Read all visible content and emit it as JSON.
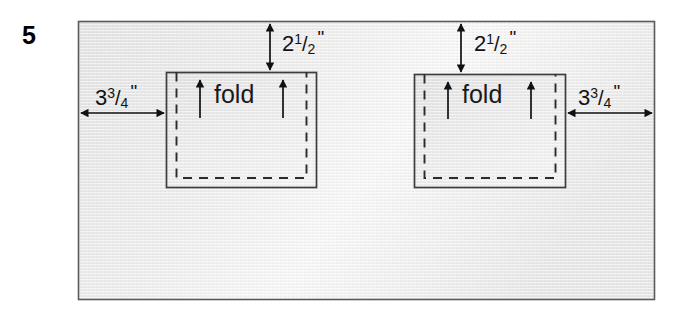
{
  "figure": {
    "problem_number": "5"
  },
  "labels": {
    "fold_left": "fold",
    "fold_right": "fold",
    "top_left_dim": {
      "whole": "2",
      "numerator": "1",
      "bar": "/",
      "denominator": "2",
      "unit": "\"",
      "full": "2 1/2\""
    },
    "top_right_dim": {
      "whole": "2",
      "numerator": "1",
      "bar": "/",
      "denominator": "2",
      "unit": "\"",
      "full": "2 1/2\""
    },
    "left_dim": {
      "whole": "3",
      "numerator": "3",
      "bar": "/",
      "denominator": "4",
      "unit": "\"",
      "full": "3 3/4\""
    },
    "right_dim": {
      "whole": "3",
      "numerator": "3",
      "bar": "/",
      "denominator": "4",
      "unit": "\"",
      "full": "3 3/4\""
    }
  },
  "colors": {
    "page_background": "#ffffff",
    "panel_fill_light": "#f4f4f4",
    "panel_fill_dark": "#e4e4e4",
    "panel_border": "#555555",
    "pocket_fill_light": "#eeeeee",
    "pocket_fill_dark": "#dddddd",
    "pocket_border": "#3a3a3a",
    "dashed_line": "#2a2a2a",
    "arrow": "#111111",
    "text": "#000000"
  },
  "geometry": {
    "panel": {
      "x": 78,
      "y": 21,
      "width": 577,
      "height": 279
    },
    "pocket_left": {
      "x": 166,
      "y": 72,
      "width": 151,
      "height": 116
    },
    "pocket_right": {
      "x": 414,
      "y": 74,
      "width": 152,
      "height": 114
    },
    "dashed_inset_left": {
      "x": 176,
      "y": 72,
      "width": 131,
      "height": 106
    },
    "dashed_inset_right": {
      "x": 424,
      "y": 74,
      "width": 132,
      "height": 104
    }
  },
  "annotations": {
    "vertical_dim_left": {
      "x": 270,
      "y1": 22,
      "y2": 72,
      "kind": "double-headed-vertical-arrow"
    },
    "vertical_dim_right": {
      "x": 461,
      "y1": 22,
      "y2": 74,
      "kind": "double-headed-vertical-arrow"
    },
    "horizontal_dim_left": {
      "y": 113,
      "x1": 79,
      "x2": 166,
      "kind": "double-headed-horizontal-arrow"
    },
    "horizontal_dim_right": {
      "y": 113,
      "x1": 566,
      "x2": 654,
      "kind": "double-headed-horizontal-arrow"
    },
    "fold_arrows_left": [
      {
        "x": 200,
        "y1": 118,
        "y2": 78
      },
      {
        "x": 283,
        "y1": 118,
        "y2": 78
      }
    ],
    "fold_arrows_right": [
      {
        "x": 448,
        "y1": 118,
        "y2": 80
      },
      {
        "x": 531,
        "y1": 118,
        "y2": 80
      }
    ]
  }
}
